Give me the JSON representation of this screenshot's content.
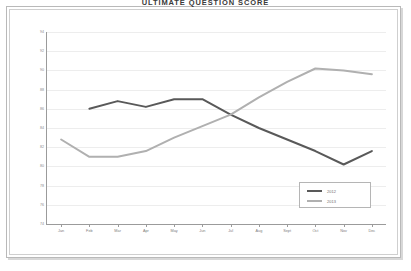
{
  "chart_title": "ULTIMATE QUESTION SCORE",
  "legend": {
    "position": "inside-bottom-right",
    "entries": [
      {
        "label": "2012",
        "color": "#595959"
      },
      {
        "label": "2013",
        "color": "#b0b0b0"
      }
    ]
  },
  "chart_data": {
    "type": "line",
    "title": "ULTIMATE QUESTION SCORE",
    "xlabel": "",
    "ylabel": "",
    "grid": true,
    "legend_position": "inside-bottom-right",
    "categories": [
      "Jan",
      "Feb",
      "Mar",
      "Apr",
      "May",
      "Jun",
      "Jul",
      "Aug",
      "Sept",
      "Oct",
      "Nov",
      "Dec"
    ],
    "ylim": [
      74,
      94
    ],
    "ytick_labels": [
      "94",
      "92",
      "90",
      "88",
      "86",
      "84",
      "82",
      "80",
      "78",
      "76",
      "74"
    ],
    "ytick_values": [
      94,
      92,
      90,
      88,
      86,
      84,
      82,
      80,
      78,
      76,
      74
    ],
    "series": [
      {
        "name": "2012",
        "color": "#595959",
        "values": [
          null,
          86.0,
          86.8,
          86.2,
          87.0,
          87.0,
          85.4,
          84.0,
          82.8,
          81.6,
          80.2,
          81.6
        ]
      },
      {
        "name": "2013",
        "color": "#b0b0b0",
        "values": [
          82.8,
          81.0,
          81.0,
          81.6,
          83.0,
          84.2,
          85.4,
          87.2,
          88.8,
          90.2,
          90.0,
          89.6
        ]
      }
    ]
  }
}
